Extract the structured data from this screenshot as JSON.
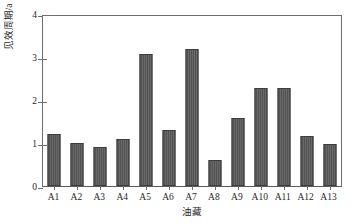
{
  "chart_data": {
    "type": "bar",
    "title": "",
    "xlabel": "油藏",
    "ylabel": "见效周期/a",
    "categories": [
      "A1",
      "A2",
      "A3",
      "A4",
      "A5",
      "A6",
      "A7",
      "A8",
      "A9",
      "A10",
      "A11",
      "A12",
      "A13"
    ],
    "values": [
      1.2,
      1.0,
      0.9,
      1.1,
      3.08,
      1.3,
      3.18,
      0.6,
      1.58,
      2.27,
      2.27,
      1.17,
      0.98
    ],
    "ylim": [
      0,
      4
    ],
    "ytick_labels": [
      "0",
      "1",
      "2",
      "3",
      "4"
    ],
    "ytick_values": [
      0,
      1,
      2,
      3,
      4
    ],
    "grid": false,
    "legend": null,
    "bar_color": "#585858",
    "axis_color": "#6e6e6e"
  },
  "axes": {
    "y_title": "见效周期/a",
    "x_title": "油藏"
  }
}
